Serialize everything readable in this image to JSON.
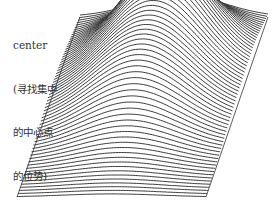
{
  "annotation": {
    "lines": [
      "center",
      "(寻找集中",
      "的中心点",
      "的位势)"
    ]
  },
  "figure": {
    "type": "3d-ridge-surface",
    "base": {
      "top_left": [
        80,
        17
      ],
      "top_right": [
        268,
        17
      ],
      "bottom_right": [
        206,
        197
      ],
      "bottom_left": [
        17,
        197
      ]
    },
    "line_count": 62,
    "line_color": "#222222",
    "fill_color": "#ffffff",
    "humps": [
      {
        "name": "back-hump",
        "u": 0.55,
        "v": 0.2,
        "su": 0.22,
        "sv": 0.12,
        "height": 55
      },
      {
        "name": "front-hump",
        "u": 0.5,
        "v": 0.45,
        "su": 0.26,
        "sv": 0.22,
        "height": 70
      }
    ]
  }
}
